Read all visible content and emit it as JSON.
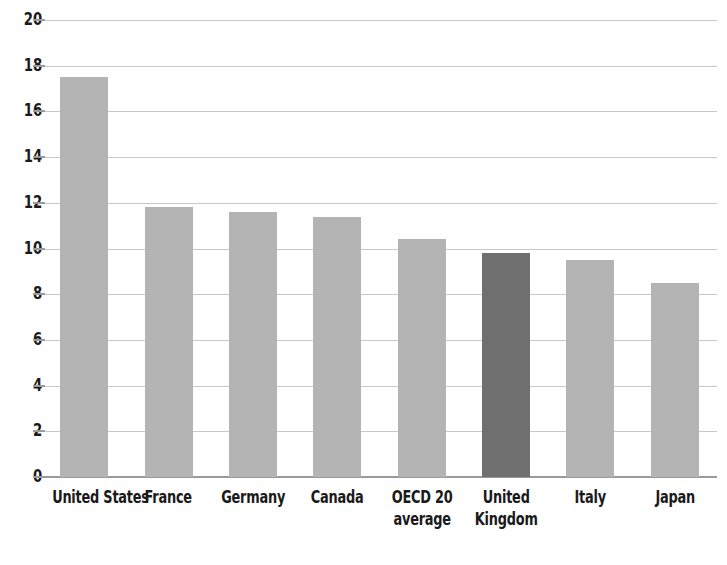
{
  "chart_data": {
    "type": "bar",
    "title": "",
    "subtitle": "",
    "xlabel": "",
    "ylabel": "",
    "ylim": [
      0,
      20
    ],
    "ytick_step": 2,
    "yticks": [
      "20",
      "18",
      "16",
      "14",
      "12",
      "10",
      "8",
      "6",
      "4",
      "2",
      "0"
    ],
    "grid": true,
    "legend": false,
    "categories": [
      "United States",
      "France",
      "Germany",
      "Canada",
      "OECD 20\naverage",
      "United\nKingdom",
      "Italy",
      "Japan"
    ],
    "category_lines": [
      [
        "United States"
      ],
      [
        "France"
      ],
      [
        "Germany"
      ],
      [
        "Canada"
      ],
      [
        "OECD 20",
        "average"
      ],
      [
        "United",
        "Kingdom"
      ],
      [
        "Italy"
      ],
      [
        "Japan"
      ]
    ],
    "values": [
      17.5,
      11.8,
      11.6,
      11.4,
      10.4,
      9.8,
      9.5,
      8.5
    ],
    "highlight_index": 5,
    "colors": {
      "bar": "#b4b4b4",
      "bar_highlight": "#6f6f6f",
      "grid": "#c8c8c8",
      "axis": "#9a9a9a",
      "text": "#1a1a1a",
      "background": "#ffffff"
    }
  }
}
